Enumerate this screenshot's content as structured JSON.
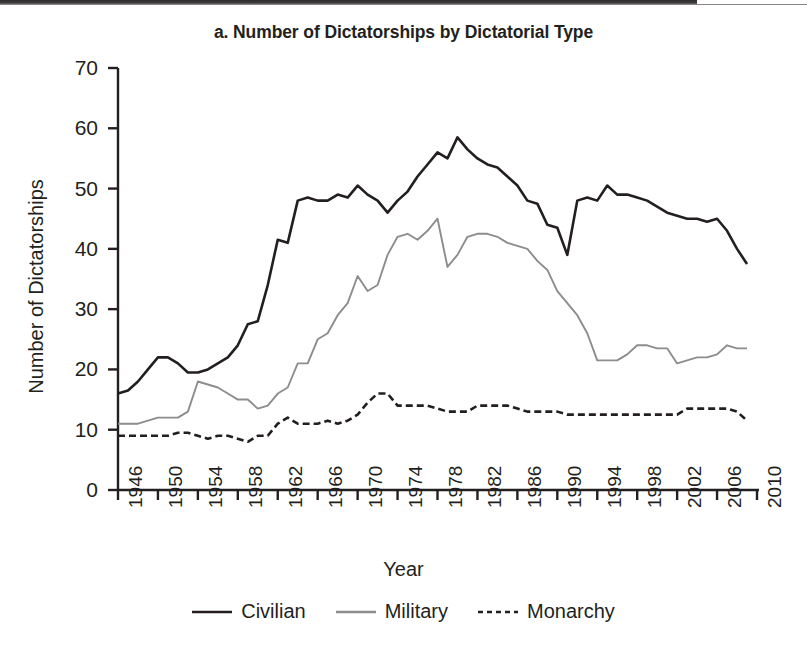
{
  "figure": {
    "title": "a. Number of Dictatorships by Dictatorial Type",
    "background": "#ffffff"
  },
  "axes": {
    "ylabel": "Number of Dictatorships",
    "xlabel": "Year",
    "ytick_labels": [
      "0",
      "10",
      "20",
      "30",
      "40",
      "50",
      "60",
      "70"
    ],
    "xtick_labels": [
      "1946",
      "1950",
      "1954",
      "1958",
      "1962",
      "1966",
      "1970",
      "1974",
      "1978",
      "1982",
      "1986",
      "1990",
      "1994",
      "1998",
      "2002",
      "2006",
      "2010"
    ]
  },
  "legend": {
    "items": [
      {
        "label": "Civilian",
        "color": "#231f20",
        "style": "solid"
      },
      {
        "label": "Military",
        "color": "#8d8d8d",
        "style": "solid"
      },
      {
        "label": "Monarchy",
        "color": "#231f20",
        "style": "dashed"
      }
    ]
  },
  "chart_data": {
    "type": "line",
    "title": "a. Number of Dictatorships by Dictatorial Type",
    "xlabel": "Year",
    "ylabel": "Number of Dictatorships",
    "xlim": [
      1946,
      2010
    ],
    "ylim": [
      0,
      70
    ],
    "ytick_interval": 10,
    "xtick_interval": 4,
    "grid": false,
    "legend_position": "below",
    "x": [
      1946,
      1947,
      1948,
      1949,
      1950,
      1951,
      1952,
      1953,
      1954,
      1955,
      1956,
      1957,
      1958,
      1959,
      1960,
      1961,
      1962,
      1963,
      1964,
      1965,
      1966,
      1967,
      1968,
      1969,
      1970,
      1971,
      1972,
      1973,
      1974,
      1975,
      1976,
      1977,
      1978,
      1979,
      1980,
      1981,
      1982,
      1983,
      1984,
      1985,
      1986,
      1987,
      1988,
      1989,
      1990,
      1991,
      1992,
      1993,
      1994,
      1995,
      1996,
      1997,
      1998,
      1999,
      2000,
      2001,
      2002,
      2003,
      2004,
      2005,
      2006,
      2007,
      2008,
      2009
    ],
    "series": [
      {
        "name": "Civilian",
        "color": "#231f20",
        "style": "solid",
        "values": [
          16,
          16.5,
          18,
          20,
          22,
          22,
          21,
          19.5,
          19.5,
          20,
          21,
          22,
          24,
          27.5,
          28,
          34,
          41.5,
          41,
          48,
          48.5,
          48,
          48,
          49,
          48.5,
          50.5,
          49,
          48,
          46,
          48,
          49.5,
          52,
          54,
          56,
          55,
          58.5,
          56.5,
          55,
          54,
          53.5,
          52,
          50.5,
          48,
          47.5,
          44,
          43.5,
          39,
          48,
          48.5,
          48,
          50.5,
          49,
          49,
          48.5,
          48,
          47,
          46,
          45.5,
          45,
          45,
          44.5,
          45,
          43,
          40,
          37.5
        ]
      },
      {
        "name": "Military",
        "color": "#8d8d8d",
        "style": "solid",
        "values": [
          11,
          11,
          11,
          11.5,
          12,
          12,
          12,
          13,
          18,
          17.5,
          17,
          16,
          15,
          15,
          13.5,
          14,
          16,
          17,
          21,
          21,
          25,
          26,
          29,
          31,
          35.5,
          33,
          34,
          39,
          42,
          42.5,
          41.5,
          43,
          45,
          37,
          39,
          42,
          42.5,
          42.5,
          42,
          41,
          40.5,
          40,
          38,
          36.5,
          33,
          31,
          29,
          26,
          21.5,
          21.5,
          21.5,
          22.5,
          24,
          24,
          23.5,
          23.5,
          21,
          21.5,
          22,
          22,
          22.5,
          24,
          23.5,
          23.5
        ]
      },
      {
        "name": "Monarchy",
        "color": "#231f20",
        "style": "dashed",
        "values": [
          9,
          9,
          9,
          9,
          9,
          9,
          9.5,
          9.5,
          9,
          8.5,
          9,
          9,
          8.5,
          8,
          9,
          9,
          11,
          12,
          11,
          11,
          11,
          11.5,
          11,
          11.5,
          12.5,
          14.5,
          16,
          16,
          14,
          14,
          14,
          14,
          13.5,
          13,
          13,
          13,
          14,
          14,
          14,
          14,
          13.5,
          13,
          13,
          13,
          13,
          12.5,
          12.5,
          12.5,
          12.5,
          12.5,
          12.5,
          12.5,
          12.5,
          12.5,
          12.5,
          12.5,
          12.5,
          13.5,
          13.5,
          13.5,
          13.5,
          13.5,
          13,
          11.5
        ]
      }
    ]
  }
}
